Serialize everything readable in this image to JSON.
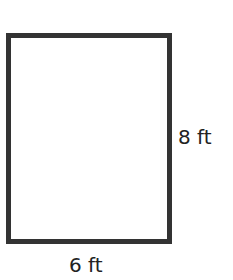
{
  "diagram": {
    "shape": "rectangle",
    "stroke_color": "#333333",
    "fill_color": "#ffffff",
    "labels": {
      "height": "8 ft",
      "width": "6 ft"
    },
    "dimensions": {
      "height_value": 8,
      "width_value": 6,
      "unit": "ft"
    }
  }
}
